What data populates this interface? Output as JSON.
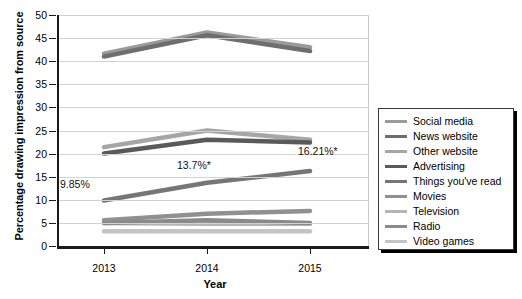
{
  "chart_data": {
    "type": "line",
    "title": "",
    "xlabel": "Year",
    "ylabel": "Percentage drawing impression from source",
    "categories": [
      "2013",
      "2014",
      "2015"
    ],
    "x": [
      2013,
      2014,
      2015
    ],
    "ylim": [
      0,
      50
    ],
    "ytick_step": 5,
    "yticks": [
      "0",
      "5",
      "10",
      "15",
      "20",
      "25",
      "30",
      "35",
      "40",
      "45",
      "50"
    ],
    "grid": true,
    "legend_position": "right",
    "series": [
      {
        "name": "Social media",
        "values": [
          41.6,
          46.2,
          43.0
        ],
        "color": "#9a9a9a"
      },
      {
        "name": "News website",
        "values": [
          41.0,
          45.6,
          42.2
        ],
        "color": "#6e6e6e"
      },
      {
        "name": "Other website",
        "values": [
          21.4,
          25.0,
          23.0
        ],
        "color": "#a6a6a6"
      },
      {
        "name": "Advertising",
        "values": [
          20.0,
          23.0,
          22.4
        ],
        "color": "#5a5a5a"
      },
      {
        "name": "Things you've read",
        "values": [
          9.85,
          13.7,
          16.21
        ],
        "color": "#767676"
      },
      {
        "name": "Movies",
        "values": [
          5.6,
          7.0,
          7.6
        ],
        "color": "#909090"
      },
      {
        "name": "Television",
        "values": [
          5.0,
          4.8,
          4.8
        ],
        "color": "#b4b4b4"
      },
      {
        "name": "Radio",
        "values": [
          5.0,
          5.6,
          5.0
        ],
        "color": "#8a8a8a"
      },
      {
        "name": "Video games",
        "values": [
          3.2,
          3.2,
          3.2
        ],
        "color": "#c4c4c4"
      }
    ],
    "annotations": [
      {
        "text": "9.85%",
        "x": 2013,
        "y": 9.85,
        "series": "Things you've read"
      },
      {
        "text": "13.7%*",
        "x": 2014,
        "y": 13.7,
        "series": "Things you've read"
      },
      {
        "text": "16.21%*",
        "x": 2015,
        "y": 16.21,
        "series": "Things you've read"
      }
    ]
  },
  "legend": {
    "items": [
      {
        "label": "Social media"
      },
      {
        "label": "News website"
      },
      {
        "label": "Other website"
      },
      {
        "label": "Advertising"
      },
      {
        "label": "Things you've read"
      },
      {
        "label": "Movies"
      },
      {
        "label": "Television"
      },
      {
        "label": "Radio"
      },
      {
        "label": "Video games"
      }
    ]
  }
}
